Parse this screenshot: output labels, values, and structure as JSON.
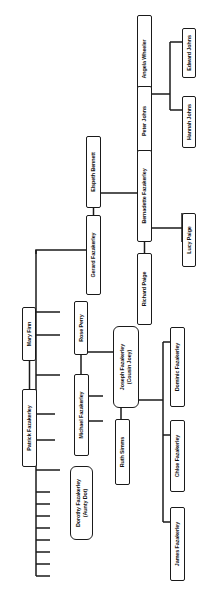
{
  "diagram": {
    "kind": "family-tree",
    "orientation": "rotated-90-ccw",
    "surname": "Fazakerley",
    "line_color": "#1a1a1a",
    "box_fill": "#ffffff",
    "background": "#ffffff"
  },
  "nodes": [
    {
      "id": "angela-wheeler",
      "label": "Angela Wheeler",
      "x": 137,
      "y": 15,
      "w": 88,
      "h": 15,
      "round": false
    },
    {
      "id": "peter-johns",
      "label": "Peter Johns",
      "x": 137,
      "y": 86,
      "w": 70,
      "h": 15,
      "round": false
    },
    {
      "id": "edward-johns",
      "label": "Edward Johns",
      "x": 182,
      "y": 28,
      "w": 50,
      "h": 14,
      "round": false
    },
    {
      "id": "hannah-johns",
      "label": "Hannah Johns",
      "x": 182,
      "y": 96,
      "w": 52,
      "h": 14,
      "round": false
    },
    {
      "id": "elspeth-bennett",
      "label": "Elspeth Bennett",
      "x": 86,
      "y": 136,
      "w": 72,
      "h": 15,
      "round": false
    },
    {
      "id": "bernadette-fazakerley",
      "label": "Bernadette Fazakerley",
      "x": 137,
      "y": 150,
      "w": 92,
      "h": 15,
      "round": false
    },
    {
      "id": "gerard-fazakerley",
      "label": "Gerard Fazakerley",
      "x": 86,
      "y": 215,
      "w": 80,
      "h": 15,
      "round": false
    },
    {
      "id": "richard-paige",
      "label": "Richard Paige",
      "x": 137,
      "y": 253,
      "w": 72,
      "h": 15,
      "round": false
    },
    {
      "id": "lucy-paige",
      "label": "Lucy Paige",
      "x": 182,
      "y": 213,
      "w": 54,
      "h": 14,
      "round": false
    },
    {
      "id": "mary-finn",
      "label": "Mary Finn",
      "x": 22,
      "y": 307,
      "w": 54,
      "h": 14,
      "round": false
    },
    {
      "id": "patrick-fazakerley",
      "label": "Patrick Fazakerley",
      "x": 22,
      "y": 389,
      "w": 78,
      "h": 15,
      "round": false
    },
    {
      "id": "rose-perry",
      "label": "Rose Perry",
      "x": 74,
      "y": 301,
      "w": 54,
      "h": 14,
      "round": false
    },
    {
      "id": "michael-fazakerley",
      "label": "Michael Fazakerley",
      "x": 74,
      "y": 374,
      "w": 82,
      "h": 15,
      "round": false
    },
    {
      "id": "dorothy-fazakerley",
      "label": "Dorothy Fazakerley\n(Aunty Dot)",
      "x": 70,
      "y": 466,
      "w": 74,
      "h": 23,
      "round": true
    },
    {
      "id": "joseph-fazakerley",
      "label": "Joseph Fazakerley\n(Cousin Joey)",
      "x": 113,
      "y": 326,
      "w": 82,
      "h": 26,
      "round": true
    },
    {
      "id": "ruth-simms",
      "label": "Ruth Simms",
      "x": 115,
      "y": 419,
      "w": 66,
      "h": 15,
      "round": false
    },
    {
      "id": "dominic-fazakerley",
      "label": "Dominic Fazakerley",
      "x": 170,
      "y": 327,
      "w": 80,
      "h": 15,
      "round": false
    },
    {
      "id": "chloe-fazakerley",
      "label": "Chloe Fazakerley",
      "x": 170,
      "y": 420,
      "w": 72,
      "h": 15,
      "round": false
    },
    {
      "id": "james-fazakerley",
      "label": "James Fazakerley",
      "x": 170,
      "y": 507,
      "w": 74,
      "h": 15,
      "round": false
    }
  ],
  "edges": [
    {
      "id": "angela-peter-union",
      "d": "M 144.5 30 L 144.5 86"
    },
    {
      "id": "peter-children-spine",
      "d": "M 152 94 L 170 94"
    },
    {
      "id": "johns-sibling-bar",
      "d": "M 170 42 L 170 110"
    },
    {
      "id": "edward-johns-stub",
      "d": "M 170 42 L 182 42"
    },
    {
      "id": "hannah-johns-stub",
      "d": "M 170 110 L 182 110"
    },
    {
      "id": "peter-bernadette",
      "d": "M 144.5 101 L 144.5 150"
    },
    {
      "id": "gerard-elspeth-union",
      "d": "M 93.5 151 L 93.5 230"
    },
    {
      "id": "gerard-elspeth-child-drop",
      "d": "M 93.5 193 L 144.5 193"
    },
    {
      "id": "bernadette-richard",
      "d": "M 144.5 165 L 144.5 253"
    },
    {
      "id": "richard-bernadette-union",
      "d": "M 144.5 228 L 182 228"
    },
    {
      "id": "lucy-paige-link",
      "d": "M 182 213 L 182 242"
    },
    {
      "id": "gerard-to-ancestor-spine",
      "d": "M 93.5 230 L 93.5 250 L 36 250 L 36 254"
    },
    {
      "id": "main-spine",
      "d": "M 36 250 L 36 576"
    },
    {
      "id": "patrick-mary-union",
      "d": "M 29.5 321 L 29.5 389"
    },
    {
      "id": "patrick-to-spine",
      "d": "M 36 335 L 60 335"
    },
    {
      "id": "spine-branch-1",
      "d": "M 36 312 L 60 312"
    },
    {
      "id": "spine-branch-2",
      "d": "M 36 375 L 60 375"
    },
    {
      "id": "spine-branch-3",
      "d": "M 36 414 L 55 414"
    },
    {
      "id": "spine-branch-4",
      "d": "M 36 440 L 55 440"
    },
    {
      "id": "spine-branch-5",
      "d": "M 36 470 L 60 470"
    },
    {
      "id": "spine-stub-1",
      "d": "M 36 492 L 50 492"
    },
    {
      "id": "spine-stub-2",
      "d": "M 36 504 L 50 504"
    },
    {
      "id": "spine-stub-3",
      "d": "M 36 516 L 50 516"
    },
    {
      "id": "spine-stub-4",
      "d": "M 36 528 L 50 528"
    },
    {
      "id": "spine-stub-5",
      "d": "M 36 540 L 50 540"
    },
    {
      "id": "spine-stub-6",
      "d": "M 36 552 L 50 552"
    },
    {
      "id": "spine-stub-7",
      "d": "M 36 564 L 50 564"
    },
    {
      "id": "spine-stub-8",
      "d": "M 36 576 L 50 576"
    },
    {
      "id": "rose-michael-union",
      "d": "M 81 315 L 81 374"
    },
    {
      "id": "michael-children-bar",
      "d": "M 88 352 L 113 352"
    },
    {
      "id": "michael-child-stub-a",
      "d": "M 88 396 L 103 396"
    },
    {
      "id": "michael-child-stub-b",
      "d": "M 88 421 L 103 421"
    },
    {
      "id": "joseph-ruth-union",
      "d": "M 121 352 L 121 419"
    },
    {
      "id": "joseph-ruth-children-drop",
      "d": "M 121 400 L 163 400"
    },
    {
      "id": "children-sibling-bar",
      "d": "M 163 342 L 163 522"
    },
    {
      "id": "dominic-stub",
      "d": "M 163 342 L 170 342"
    },
    {
      "id": "chloe-stub",
      "d": "M 163 435 L 170 435"
    },
    {
      "id": "james-stub",
      "d": "M 163 522 L 170 522"
    }
  ]
}
